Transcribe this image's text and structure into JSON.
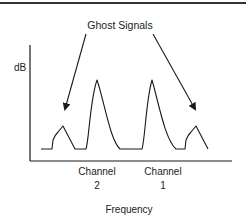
{
  "diagram": {
    "annotation": "Ghost Signals",
    "y_axis_label": "dB",
    "x_axis_label": "Frequency",
    "channels": [
      {
        "name_line1": "Channel",
        "name_line2": "2"
      },
      {
        "name_line1": "Channel",
        "name_line2": "1"
      }
    ],
    "peaks": [
      {
        "label": "ghost-left",
        "x": 63,
        "y": 126
      },
      {
        "label": "Channel 2",
        "x": 97,
        "y": 80
      },
      {
        "label": "Channel 1",
        "x": 152,
        "y": 80
      },
      {
        "label": "ghost-right",
        "x": 196,
        "y": 126
      }
    ],
    "colors": {
      "line": "#1a1a1a",
      "text": "#222222",
      "background": "#ffffff"
    }
  }
}
